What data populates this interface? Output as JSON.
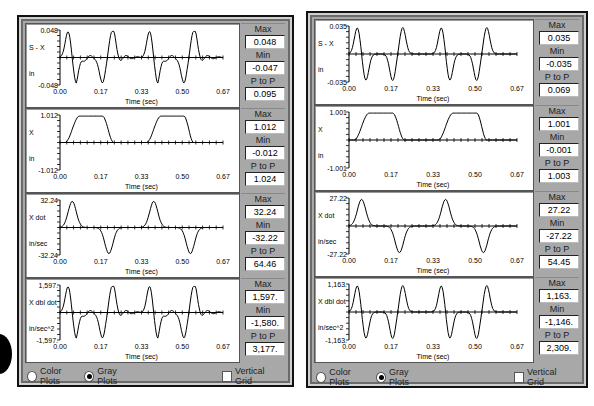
{
  "windows": [
    {
      "id": "left",
      "plots": [
        {
          "signal": "S - X",
          "unit": "in",
          "ymax_label": "0.048",
          "ymin_label": "-0.048",
          "stats": {
            "max": "0.048",
            "min": "-0.047",
            "p_to_p": "0.095"
          }
        },
        {
          "signal": "X",
          "unit": "in",
          "ymax_label": "1.012",
          "ymin_label": "-1.012",
          "stats": {
            "max": "1.012",
            "min": "-0.012",
            "p_to_p": "1.024"
          }
        },
        {
          "signal": "X dot",
          "unit": "in/sec",
          "ymax_label": "32.24",
          "ymin_label": "-32.24",
          "stats": {
            "max": "32.24",
            "min": "-32.22",
            "p_to_p": "64.46"
          }
        },
        {
          "signal": "X dbl dot",
          "unit": "in/sec^2",
          "ymax_label": "1,597.",
          "ymin_label": "-1,597.",
          "stats": {
            "max": "1,597.",
            "min": "-1,580.",
            "p_to_p": "3,177."
          }
        }
      ],
      "footer": {
        "color_plots": "Color Plots",
        "gray_plots": "Gray Plots",
        "vertical_grid": "Vertical Grid",
        "selected": "gray",
        "vertical_grid_checked": false
      }
    },
    {
      "id": "right",
      "plots": [
        {
          "signal": "S - X",
          "unit": "in",
          "ymax_label": "0.035",
          "ymin_label": "-0.035",
          "stats": {
            "max": "0.035",
            "min": "-0.035",
            "p_to_p": "0.069"
          }
        },
        {
          "signal": "X",
          "unit": "in",
          "ymax_label": "1.001",
          "ymin_label": "-1.001",
          "stats": {
            "max": "1.001",
            "min": "-0.001",
            "p_to_p": "1.003"
          }
        },
        {
          "signal": "X dot",
          "unit": "in/sec",
          "ymax_label": "27.22",
          "ymin_label": "-27.22",
          "stats": {
            "max": "27.22",
            "min": "-27.22",
            "p_to_p": "54.45"
          }
        },
        {
          "signal": "X dbl dot",
          "unit": "in/sec^2",
          "ymax_label": "1,163.",
          "ymin_label": "-1,163.",
          "stats": {
            "max": "1,163.",
            "min": "-1,146.",
            "p_to_p": "2,309."
          }
        }
      ],
      "footer": {
        "color_plots": "Color Plots",
        "gray_plots": "Gray Plots",
        "vertical_grid": "Vertical Grid",
        "selected": "gray",
        "vertical_grid_checked": false
      }
    }
  ],
  "stat_labels": {
    "max": "Max",
    "min": "Min",
    "p_to_p": "P to P"
  },
  "x_axis": {
    "label": "Time (sec)",
    "ticks": [
      "0.00",
      "0.17",
      "0.33",
      "0.50",
      "0.67"
    ]
  },
  "chart_data": [
    {
      "type": "line",
      "title": "Left - S - X",
      "xlabel": "Time (sec)",
      "ylabel": "S - X (in)",
      "x_ticks": [
        "0.00",
        "0.17",
        "0.33",
        "0.50",
        "0.67"
      ],
      "ylim": [
        -0.048,
        0.048
      ],
      "description": "residual vibration, oscillatory peaks near t=0.02,0.22,0.36,0.50",
      "max": 0.048,
      "min": -0.047,
      "p_to_p": 0.095
    },
    {
      "type": "line",
      "title": "Left - X",
      "xlabel": "Time (sec)",
      "ylabel": "X (in)",
      "x_ticks": [
        "0.00",
        "0.17",
        "0.33",
        "0.50",
        "0.67"
      ],
      "ylim": [
        -1.012,
        1.012
      ],
      "description": "trapezoidal displacement pulses 0.02-0.22 and 0.35-0.53",
      "max": 1.012,
      "min": -0.012,
      "p_to_p": 1.024
    },
    {
      "type": "line",
      "title": "Left - X dot",
      "xlabel": "Time (sec)",
      "ylabel": "X dot (in/sec)",
      "x_ticks": [
        "0.00",
        "0.17",
        "0.33",
        "0.50",
        "0.67"
      ],
      "ylim": [
        -32.24,
        32.24
      ],
      "max": 32.24,
      "min": -32.22,
      "p_to_p": 64.46
    },
    {
      "type": "line",
      "title": "Left - X dbl dot",
      "xlabel": "Time (sec)",
      "ylabel": "X dbl dot (in/sec^2)",
      "x_ticks": [
        "0.00",
        "0.17",
        "0.33",
        "0.50",
        "0.67"
      ],
      "ylim": [
        -1597,
        1597
      ],
      "max": 1597,
      "min": -1580,
      "p_to_p": 3177
    },
    {
      "type": "line",
      "title": "Right - S - X",
      "xlabel": "Time (sec)",
      "ylabel": "S - X (in)",
      "x_ticks": [
        "0.00",
        "0.17",
        "0.33",
        "0.50",
        "0.67"
      ],
      "ylim": [
        -0.035,
        0.035
      ],
      "max": 0.035,
      "min": -0.035,
      "p_to_p": 0.069
    },
    {
      "type": "line",
      "title": "Right - X",
      "xlabel": "Time (sec)",
      "ylabel": "X (in)",
      "x_ticks": [
        "0.00",
        "0.17",
        "0.33",
        "0.50",
        "0.67"
      ],
      "ylim": [
        -1.001,
        1.001
      ],
      "max": 1.001,
      "min": -0.001,
      "p_to_p": 1.003
    },
    {
      "type": "line",
      "title": "Right - X dot",
      "xlabel": "Time (sec)",
      "ylabel": "X dot (in/sec)",
      "x_ticks": [
        "0.00",
        "0.17",
        "0.33",
        "0.50",
        "0.67"
      ],
      "ylim": [
        -27.22,
        27.22
      ],
      "max": 27.22,
      "min": -27.22,
      "p_to_p": 54.45
    },
    {
      "type": "line",
      "title": "Right - X dbl dot",
      "xlabel": "Time (sec)",
      "ylabel": "X dbl dot (in/sec^2)",
      "x_ticks": [
        "0.00",
        "0.17",
        "0.33",
        "0.50",
        "0.67"
      ],
      "ylim": [
        -1163,
        1163
      ],
      "max": 1163,
      "min": -1146,
      "p_to_p": 2309
    }
  ]
}
